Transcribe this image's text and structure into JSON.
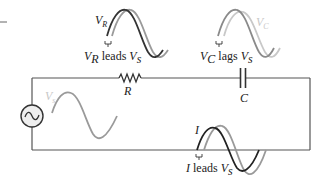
{
  "diagram": {
    "colors": {
      "wire": "#555555",
      "dark_wave": "#333333",
      "gray_wave": "#9a9a9a",
      "light_wave": "#c8c8c8",
      "source_fill": "#eeeeee"
    },
    "components": {
      "source": {
        "symbol": "~",
        "label": "V",
        "label_sub": "s"
      },
      "resistor": {
        "label": "R"
      },
      "capacitor": {
        "label": "C"
      }
    },
    "waveforms": {
      "vr": {
        "label": "V",
        "label_sub": "R",
        "caption_a": "V",
        "caption_a_sub": "R",
        "caption_mid": " leads ",
        "caption_b": "V",
        "caption_b_sub": "s"
      },
      "vc": {
        "label": "V",
        "label_sub": "C",
        "caption_a": "V",
        "caption_a_sub": "C",
        "caption_mid": " lags ",
        "caption_b": "V",
        "caption_b_sub": "s"
      },
      "vs": {
        "label": "V",
        "label_sub": "s"
      },
      "i": {
        "label": "I",
        "caption_a": "I",
        "caption_mid": " leads ",
        "caption_b": "V",
        "caption_b_sub": "s"
      }
    }
  }
}
